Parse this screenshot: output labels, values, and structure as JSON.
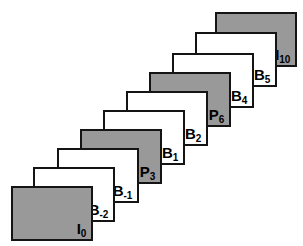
{
  "diagram": {
    "background_color": "#ffffff",
    "border_color": "#141414",
    "gray_fill": "#999999",
    "white_fill": "#ffffff",
    "frames": [
      {
        "id": "frame-i0",
        "base": "I",
        "sub": "0",
        "label": "I0",
        "type": "gray",
        "x": 11,
        "y": 186,
        "w": 82,
        "h": 55,
        "z": 10
      },
      {
        "id": "frame-b-2",
        "base": "B",
        "sub": "-2",
        "label": "B-2",
        "type": "white",
        "x": 33,
        "y": 167,
        "w": 82,
        "h": 55,
        "z": 9
      },
      {
        "id": "frame-b-1",
        "base": "B",
        "sub": "-1",
        "label": "B-1",
        "type": "white",
        "x": 57,
        "y": 148,
        "w": 82,
        "h": 55,
        "z": 8
      },
      {
        "id": "frame-p3",
        "base": "P",
        "sub": "3",
        "label": "P3",
        "type": "gray",
        "x": 80,
        "y": 129,
        "w": 82,
        "h": 55,
        "z": 7
      },
      {
        "id": "frame-b1",
        "base": "B",
        "sub": "1",
        "label": "B1",
        "type": "white",
        "x": 103,
        "y": 110,
        "w": 82,
        "h": 55,
        "z": 6
      },
      {
        "id": "frame-b2",
        "base": "B",
        "sub": "2",
        "label": "B2",
        "type": "white",
        "x": 126,
        "y": 91,
        "w": 82,
        "h": 55,
        "z": 5
      },
      {
        "id": "frame-p6",
        "base": "P",
        "sub": "6",
        "label": "P6",
        "type": "gray",
        "x": 149,
        "y": 72,
        "w": 82,
        "h": 55,
        "z": 4
      },
      {
        "id": "frame-b4",
        "base": "B",
        "sub": "4",
        "label": "B4",
        "type": "white",
        "x": 172,
        "y": 53,
        "w": 82,
        "h": 55,
        "z": 3
      },
      {
        "id": "frame-b5",
        "base": "B",
        "sub": "5",
        "label": "B5",
        "type": "white",
        "x": 195,
        "y": 32,
        "w": 82,
        "h": 55,
        "z": 2
      },
      {
        "id": "frame-i10",
        "base": "I",
        "sub": "10",
        "label": "I10",
        "type": "gray",
        "x": 215,
        "y": 12,
        "w": 82,
        "h": 55,
        "z": 1
      }
    ]
  }
}
